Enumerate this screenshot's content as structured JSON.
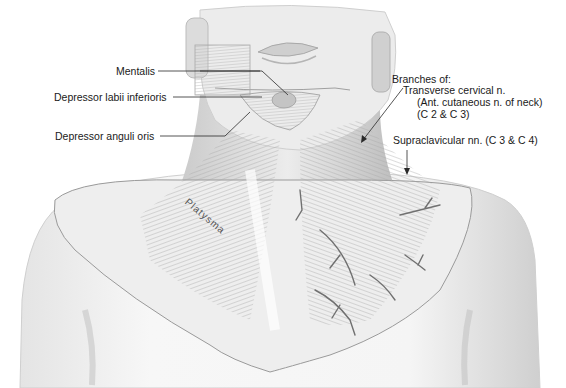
{
  "figure": {
    "colors": {
      "background": "#ffffff",
      "skin": "#f3f3f3",
      "skin_shadow": "#d6d6d6",
      "muscle": "#bdbdbd",
      "muscle_dark": "#8e8e8e",
      "nerve": "#6e6e6e",
      "label_text": "#1a1a1a",
      "leader_line": "#2a2a2a"
    }
  },
  "labels": {
    "mentalis": "Mentalis",
    "depressor_labii": "Depressor labii inferioris",
    "depressor_anguli": "Depressor anguli oris",
    "branches_of": "Branches of:",
    "transverse_cervical": "Transverse cervical n.",
    "ant_cutaneous": "(Ant. cutaneous n. of neck)",
    "c2_c3": "(C 2 & C 3)",
    "supraclavicular": "Supraclavicular nn. (C 3 & C 4)",
    "platysma": "Platysma"
  }
}
